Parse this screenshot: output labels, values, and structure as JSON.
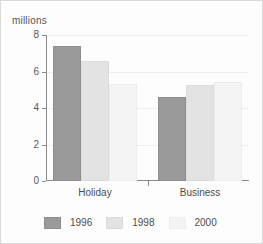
{
  "chart_data": {
    "type": "bar",
    "title": "",
    "subtitle": "",
    "xlabel": "",
    "ylabel": "millions",
    "categories": [
      "Holiday",
      "Business"
    ],
    "series": [
      {
        "name": "1996",
        "color": "#9a9a9a",
        "values": [
          7.4,
          4.6
        ]
      },
      {
        "name": "1998",
        "color": "#e3e3e3",
        "values": [
          6.6,
          5.25
        ]
      },
      {
        "name": "2000",
        "color": "#f4f4f4",
        "values": [
          5.3,
          5.4
        ]
      }
    ],
    "ylim": [
      0,
      8
    ],
    "yticks": [
      0,
      2,
      4,
      6,
      8
    ],
    "ytick_labels": [
      "0",
      "2",
      "4",
      "6",
      "8"
    ],
    "grid": true,
    "legend_position": "bottom"
  }
}
